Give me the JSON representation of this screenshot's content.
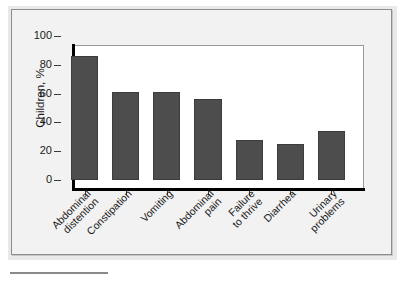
{
  "figure": {
    "background_color": "#ffffff",
    "panel_background_color": "#f2f2f2",
    "panel_border_color": "#8d8d8d",
    "plot_background_color": "#ffffff"
  },
  "chart_data": {
    "type": "bar",
    "title": "",
    "subtitle": "",
    "xlabel": "",
    "ylabel": "Children, %",
    "ylim": [
      0,
      100
    ],
    "yticks": [
      0,
      20,
      40,
      60,
      80,
      100
    ],
    "ytick_labels": [
      "0",
      "20",
      "40",
      "60",
      "80",
      "100"
    ],
    "grid": false,
    "legend": null,
    "bar_color": "#4d4d4d",
    "bar_edge_color": "#3c3c3c",
    "categories": [
      "Abdominal\ndistention",
      "Constipation",
      "Vomiting",
      "Abdominal\npain",
      "Failure\nto thrive",
      "Diarrhea",
      "Urinary\nproblems"
    ],
    "category_labels_rotation_deg": -45,
    "values": [
      86,
      61,
      61,
      56,
      28,
      25,
      34
    ],
    "annotations": []
  }
}
